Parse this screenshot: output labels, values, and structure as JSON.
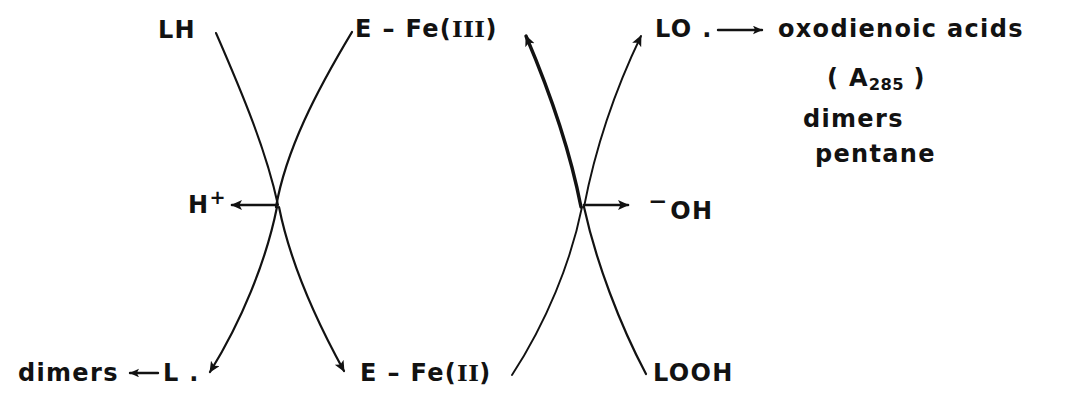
{
  "diagram": {
    "ink_color": "#121212",
    "background_color": "#ffffff"
  },
  "labels": {
    "substrate_lh": "LH",
    "enzyme_fe3": "E – Fe(",
    "enzyme_fe3_roman": "III",
    "enzyme_fe3_close": ")",
    "alkoxyl_radical": "LO .",
    "products_line1": "oxodienoic  acids",
    "products_line2_open": "( A",
    "products_line2_sub": "285",
    "products_line2_close": " )",
    "products_line3": "dimers",
    "products_line4": "pentane",
    "proton": "H",
    "proton_charge": "+",
    "hydroxide_charge": "−",
    "hydroxide": "OH",
    "dimers_left": "dimers",
    "dimers_arrow": "←",
    "lipid_radical": "L .",
    "enzyme_fe2": "E – Fe(",
    "enzyme_fe2_roman": "II",
    "enzyme_fe2_close": ")",
    "hydroperoxide": "LOOH"
  },
  "arrows": {
    "h_plus_arrow": "arrow-left-to-h-plus",
    "oh_minus_arrow": "arrow-right-to-oh-minus",
    "products_arrow": "arrow-right-to-products",
    "dimers_arrow": "arrow-left-to-dimers"
  },
  "curves": {
    "left_cross_x": 278,
    "left_cross_y": 205,
    "right_cross_x": 583,
    "right_cross_y": 205,
    "endpoints": {
      "lh_top_left": [
        215,
        32
      ],
      "efe3_top_right": [
        352,
        30
      ],
      "ldot_bottom_left": [
        205,
        378
      ],
      "efe2_bottom_right": [
        348,
        377
      ],
      "efe3_arrow_top_left": [
        521,
        30
      ],
      "lo_arrow_top_right": [
        645,
        30
      ],
      "efe2_line_bottom_left": [
        512,
        378
      ],
      "looh_bottom_right": [
        645,
        378
      ]
    }
  }
}
